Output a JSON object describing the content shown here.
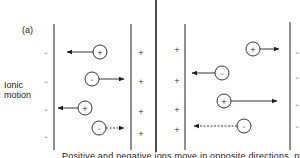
{
  "figure": {
    "panel_label": "(a)",
    "side_label_line1": "Ionic",
    "side_label_line2": "motion",
    "caption": "Positive and negative ions move in opposite directions, producing the"
  },
  "electrodes": {
    "left_cell_left_charges": [
      "–",
      "–",
      "–",
      "–"
    ],
    "left_cell_right_charges": [
      "+",
      "+",
      "+",
      "+"
    ],
    "right_cell_left_charges": [
      "+",
      "+",
      "+",
      "+"
    ],
    "right_cell_right_charges": [
      "–",
      "–",
      "–",
      "–"
    ]
  },
  "ions": [
    {
      "cell": "left",
      "charge": "+",
      "direction": "left",
      "line": "solid"
    },
    {
      "cell": "left",
      "charge": "–",
      "direction": "right",
      "line": "solid"
    },
    {
      "cell": "left",
      "charge": "+",
      "direction": "left",
      "line": "solid"
    },
    {
      "cell": "left",
      "charge": "–",
      "direction": "right",
      "line": "dashed"
    },
    {
      "cell": "right",
      "charge": "+",
      "direction": "right",
      "line": "solid"
    },
    {
      "cell": "right",
      "charge": "–",
      "direction": "left",
      "line": "solid"
    },
    {
      "cell": "right",
      "charge": "+",
      "direction": "right",
      "line": "solid"
    },
    {
      "cell": "right",
      "charge": "–",
      "direction": "left",
      "line": "dashed"
    }
  ],
  "colors": {
    "ink": "#1e1e1e",
    "background": "#ffffff"
  }
}
